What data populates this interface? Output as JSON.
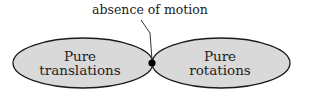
{
  "diagram": {
    "top_label": "absence of motion",
    "left_region": {
      "line1": "Pure",
      "line2": "translations"
    },
    "right_region": {
      "line1": "Pure",
      "line2": "rotations"
    },
    "colors": {
      "fill": "#d9d9d9",
      "stroke": "#1a1a1a",
      "dot": "#000000"
    }
  }
}
